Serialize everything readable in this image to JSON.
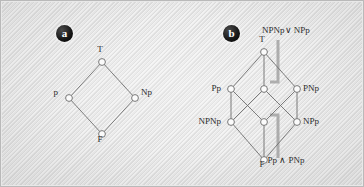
{
  "figure": {
    "panels": [
      {
        "badge": "a",
        "badge_pos": [
          56,
          25
        ],
        "nodes": [
          {
            "id": "a-top",
            "label": "T",
            "x": 102,
            "y": 62,
            "label_dx": -2,
            "label_dy": -13,
            "label_anchor": "center"
          },
          {
            "id": "a-left",
            "label": "p",
            "x": 69,
            "y": 98,
            "label_dx": -11,
            "label_dy": -6,
            "label_anchor": "right"
          },
          {
            "id": "a-right",
            "label": "Np",
            "x": 135,
            "y": 98,
            "label_dx": 6,
            "label_dy": -6,
            "label_anchor": "left"
          },
          {
            "id": "a-bottom",
            "label": "F",
            "x": 102,
            "y": 134,
            "label_dx": -2,
            "label_dy": 5,
            "label_anchor": "center"
          }
        ],
        "edges": [
          [
            "a-top",
            "a-left"
          ],
          [
            "a-top",
            "a-right"
          ],
          [
            "a-left",
            "a-bottom"
          ],
          [
            "a-right",
            "a-bottom"
          ]
        ],
        "annotations": []
      },
      {
        "badge": "b",
        "badge_pos": [
          223,
          25
        ],
        "nodes": [
          {
            "id": "b-top",
            "label": "T",
            "x": 264,
            "y": 52,
            "label_dx": -2,
            "label_dy": -13,
            "label_anchor": "center"
          },
          {
            "id": "b-ml",
            "label": "Pp",
            "x": 231,
            "y": 89,
            "label_dx": -10,
            "label_dy": -1,
            "label_anchor": "right"
          },
          {
            "id": "b-mc",
            "label": "",
            "x": 264,
            "y": 89,
            "label_dx": 0,
            "label_dy": 0,
            "label_anchor": "center"
          },
          {
            "id": "b-mr",
            "label": "PNp",
            "x": 297,
            "y": 89,
            "label_dx": 6,
            "label_dy": -1,
            "label_anchor": "left"
          },
          {
            "id": "b-ll",
            "label": "NPNp",
            "x": 231,
            "y": 122,
            "label_dx": -10,
            "label_dy": -1,
            "label_anchor": "right"
          },
          {
            "id": "b-lc",
            "label": "",
            "x": 264,
            "y": 122,
            "label_dx": 0,
            "label_dy": 0,
            "label_anchor": "center"
          },
          {
            "id": "b-lr",
            "label": "NPp",
            "x": 297,
            "y": 122,
            "label_dx": 6,
            "label_dy": -1,
            "label_anchor": "left"
          },
          {
            "id": "b-bottom",
            "label": "F",
            "x": 264,
            "y": 160,
            "label_dx": -2,
            "label_dy": 4,
            "label_anchor": "center"
          }
        ],
        "edges": [
          [
            "b-top",
            "b-ml"
          ],
          [
            "b-top",
            "b-mc"
          ],
          [
            "b-top",
            "b-mr"
          ],
          [
            "b-ml",
            "b-ll"
          ],
          [
            "b-ml",
            "b-lc"
          ],
          [
            "b-mc",
            "b-ll"
          ],
          [
            "b-mc",
            "b-lr"
          ],
          [
            "b-mr",
            "b-lc"
          ],
          [
            "b-mr",
            "b-lr"
          ],
          [
            "b-ll",
            "b-bottom"
          ],
          [
            "b-lc",
            "b-bottom"
          ],
          [
            "b-lr",
            "b-bottom"
          ]
        ],
        "annotations": [
          {
            "id": "annot-join",
            "text": "NPNp∨ NPp",
            "text_x": 286,
            "text_y": 30,
            "pointer": "M 278 40 L 278 82 L 270 82",
            "target": "b-mc"
          },
          {
            "id": "annot-meet",
            "text": "Pp ∧ PNp",
            "text_x": 286,
            "text_y": 160,
            "pointer": "M 278 158 L 278 115 L 270 115",
            "target": "b-lc"
          }
        ]
      }
    ],
    "style": {
      "node_fill": "#fbfbfb",
      "node_stroke": "#6a6a6a",
      "edge_stroke": "#6e6e6e",
      "pointer_stroke": "#a2a2a2",
      "badge_bg": "#101010",
      "badge_fg": "#ffffff",
      "label_color": "#2b2b2b",
      "frame_color": "#b9b9b9",
      "paper_color": "#e2e2e2"
    }
  }
}
